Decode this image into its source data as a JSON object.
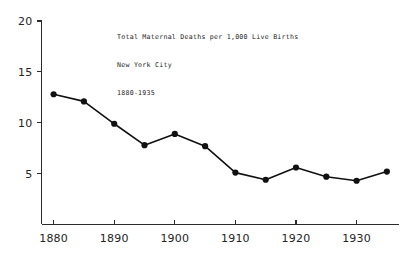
{
  "chart_data": {
    "type": "line",
    "title": "Total Maternal Deaths per 1,000 Live Births",
    "title_lines": [
      "Total Maternal Deaths per 1,000 Live Births",
      "New York City",
      "1880-1935"
    ],
    "subtitle": "New York City",
    "period": "1880-1935",
    "xlabel": "",
    "ylabel": "",
    "x": [
      1880,
      1885,
      1890,
      1895,
      1900,
      1905,
      1910,
      1915,
      1920,
      1925,
      1930,
      1935
    ],
    "values": [
      12.8,
      12.1,
      9.9,
      7.8,
      8.9,
      7.7,
      5.1,
      4.4,
      5.6,
      4.7,
      4.3,
      5.2
    ],
    "series": [
      {
        "name": "Total maternal deaths per 1,000 live births",
        "values": [
          12.8,
          12.1,
          9.9,
          7.8,
          8.9,
          7.7,
          5.1,
          4.4,
          5.6,
          4.7,
          4.3,
          5.2
        ]
      }
    ],
    "xlim": [
      1878,
      1937
    ],
    "ylim": [
      0,
      20
    ],
    "xticks": [
      1880,
      1890,
      1900,
      1910,
      1920,
      1930
    ],
    "xtick_labels": [
      "1880",
      "1890",
      "1900",
      "1910",
      "1920",
      "1930"
    ],
    "yticks": [
      5,
      10,
      15,
      20
    ],
    "ytick_labels": [
      "5",
      "10",
      "15",
      "20"
    ],
    "grid": false,
    "legend": "none",
    "marker": "filled-circle",
    "line_color": "#111111",
    "marker_color": "#111111",
    "axis_color": "#2b2b2b",
    "background": "#ffffff"
  }
}
